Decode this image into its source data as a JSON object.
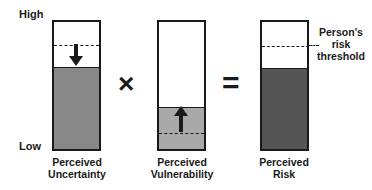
{
  "axis": {
    "high_label": "High",
    "low_label": "Low"
  },
  "bars": [
    {
      "label_line1": "Perceived",
      "label_line2": "Uncertainty",
      "fill_color": "#888888",
      "fill_level_pct": 68,
      "threshold_pct": 86,
      "arrow": "down"
    },
    {
      "label_line1": "Perceived",
      "label_line2": "Vulnerability",
      "fill_color": "#a9a9a9",
      "fill_level_pct": 34,
      "threshold_pct": 14,
      "arrow": "up"
    },
    {
      "label_line1": "Perceived",
      "label_line2": "Risk",
      "fill_color": "#555555",
      "fill_level_pct": 68,
      "threshold_pct": 85,
      "arrow": "none"
    }
  ],
  "operators": {
    "multiply": "×",
    "equals": "="
  },
  "threshold_annotation": {
    "line1": "Person's",
    "line2": "risk",
    "line3": "threshold"
  }
}
